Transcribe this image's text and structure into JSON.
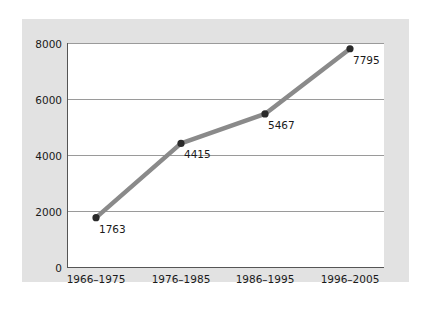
{
  "chart_data": {
    "type": "line",
    "title": "",
    "xlabel": "",
    "ylabel": "",
    "categories": [
      "1966–1975",
      "1976–1985",
      "1986–1995",
      "1996–2005"
    ],
    "values": [
      1763,
      4415,
      5467,
      7795
    ],
    "data_labels": [
      "1763",
      "4415",
      "5467",
      "7795"
    ],
    "y_ticks": [
      0,
      2000,
      4000,
      6000,
      8000
    ],
    "y_tick_labels": [
      "0",
      "2000",
      "4000",
      "6000",
      "8000"
    ],
    "ylim": [
      0,
      8000
    ],
    "grid": true,
    "legend": "none",
    "colors": {
      "panel_background": "#e2e2e2",
      "plot_background": "#ffffff",
      "line": "#8a8a8a",
      "marker": "#2a2a2a",
      "gridline": "#9a9a9a",
      "axis": "#555555",
      "text": "#1a1a1a"
    }
  }
}
